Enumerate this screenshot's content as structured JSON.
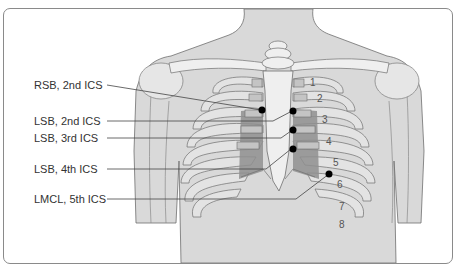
{
  "figure": {
    "type": "anatomical-diagram"
  },
  "labels": [
    {
      "text": "RSB, 2nd ICS"
    },
    {
      "text": "LSB, 2nd ICS"
    },
    {
      "text": "LSB, 3rd ICS"
    },
    {
      "text": "LSB, 4th ICS"
    },
    {
      "text": "LMCL, 5th ICS"
    }
  ],
  "rib_numbers": [
    "1",
    "2",
    "3",
    "4",
    "5",
    "6",
    "7",
    "8"
  ],
  "colors": {
    "skin": "#d9d9d9",
    "bone": "#efefef",
    "cartilage": "#c4c4c4",
    "dark_region": "#8f8f8f",
    "outline": "#6e6e6e",
    "marker": "#000000",
    "leader_line": "#444444"
  }
}
